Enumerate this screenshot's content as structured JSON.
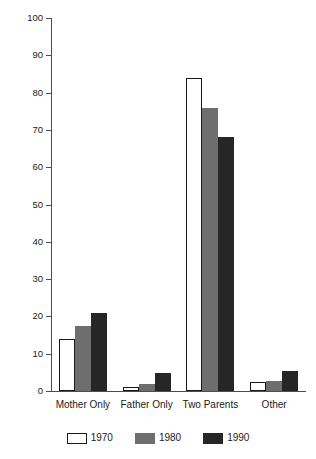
{
  "chart_data": {
    "type": "bar",
    "title": "",
    "xlabel": "",
    "ylabel": "Percent of Children",
    "ylim": [
      0,
      100
    ],
    "ytick_labels": [
      "0",
      "10",
      "20",
      "30",
      "40",
      "50",
      "60",
      "70",
      "80",
      "90",
      "100"
    ],
    "ytick_values": [
      0,
      10,
      20,
      30,
      40,
      50,
      60,
      70,
      80,
      90,
      100
    ],
    "grid": false,
    "legend_position": "bottom",
    "categories": [
      "Mother Only",
      "Father Only",
      "Two Parents",
      "Other"
    ],
    "series": [
      {
        "name": "1970",
        "color": "#ffffff",
        "edge_color": "#1a1a1a",
        "values": [
          14,
          1.2,
          84,
          2.4
        ]
      },
      {
        "name": "1980",
        "color": "#6e6e6e",
        "edge_color": "#6e6e6e",
        "values": [
          17.5,
          2,
          76,
          2.7
        ]
      },
      {
        "name": "1990",
        "color": "#262626",
        "edge_color": "#262626",
        "values": [
          21,
          4.8,
          68,
          5.3
        ]
      }
    ]
  }
}
